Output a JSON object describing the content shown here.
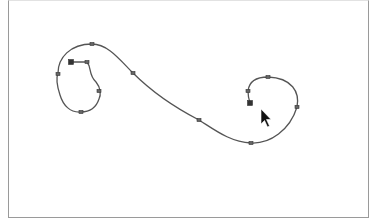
{
  "canvas": {
    "background": "#ffffff",
    "frame_color": "#9a9a9a",
    "stroke_color": "#555555"
  },
  "path": {
    "name": "s-curve-bezier-path",
    "d": "M71,62 L87,62 C92,68 88,74 96,82 C101,88 101,95 99,99 C96,108 90,112 81,112 C70,113 63,105 60,95 C57,86 56,78 58,73 C58,58 70,44 92,44 C108,44 120,60 133,73 C150,90 170,105 199,120 C215,130 230,142 251,143 C270,144 290,130 297,107 C300,92 292,78 268,77 C255,77 249,82 248,91 C248,96 249,100 250,103",
    "anchors": [
      {
        "x": 71,
        "y": 62,
        "type": "endpoint"
      },
      {
        "x": 87,
        "y": 62,
        "type": "corner"
      },
      {
        "x": 99,
        "y": 91,
        "type": "smooth"
      },
      {
        "x": 81,
        "y": 112,
        "type": "smooth"
      },
      {
        "x": 58,
        "y": 74,
        "type": "smooth"
      },
      {
        "x": 92,
        "y": 44,
        "type": "smooth"
      },
      {
        "x": 133,
        "y": 73,
        "type": "smooth"
      },
      {
        "x": 199,
        "y": 120,
        "type": "smooth"
      },
      {
        "x": 251,
        "y": 143,
        "type": "smooth"
      },
      {
        "x": 297,
        "y": 107,
        "type": "smooth"
      },
      {
        "x": 268,
        "y": 77,
        "type": "smooth"
      },
      {
        "x": 248,
        "y": 91,
        "type": "smooth"
      },
      {
        "x": 250,
        "y": 103,
        "type": "endpoint"
      }
    ]
  },
  "cursor": {
    "icon": "arrow-pointer-icon",
    "x": 261,
    "y": 109,
    "color": "#111111"
  }
}
